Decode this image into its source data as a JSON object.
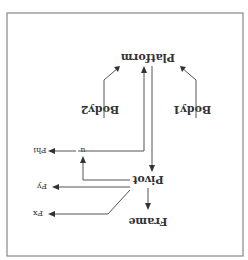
{
  "diagram": {
    "orientation_rotation_deg": 180,
    "border_color": "#888888",
    "line_color": "#555555",
    "text_color": "#333333",
    "nodes": {
      "platform": "Platform",
      "body1": "Body1",
      "body2": "Body2",
      "pivot": "Pivot",
      "frame": "Frame",
      "u": "u"
    },
    "signals": {
      "phi": "Phi",
      "fy": "Fy",
      "fx": "Fx"
    },
    "edges": [
      {
        "from": "Body1",
        "to": "Platform"
      },
      {
        "from": "Body2",
        "to": "Platform"
      },
      {
        "from": "Platform",
        "to": "Pivot"
      },
      {
        "from": "u",
        "to": "Platform"
      },
      {
        "from": "Pivot",
        "to": "u"
      },
      {
        "from": "u",
        "to": "Phi"
      },
      {
        "from": "Pivot",
        "to": "Fy"
      },
      {
        "from": "Pivot",
        "to": "Fx"
      },
      {
        "from": "Pivot",
        "to": "Frame"
      }
    ]
  }
}
